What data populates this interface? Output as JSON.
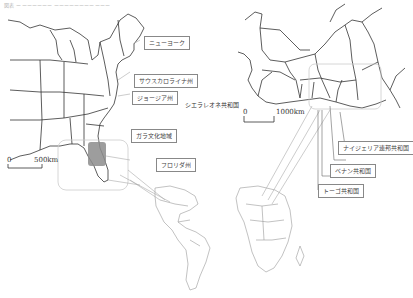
{
  "caption": "図表 ー ーーーーーー ーーーーーーーー ーーー",
  "labels": {
    "new_york": "ニューヨーク",
    "south_carolina": "サウスカロライナ州",
    "georgia": "ジョージア州",
    "gullah": "ガラ文化地域",
    "florida": "フロリダ州",
    "sierra_leone": "シエラレオネ共和国",
    "nigeria": "ナイジェリア連邦共和国",
    "benin": "ベナン共和国",
    "togo": "トーゴ共和国"
  },
  "scales": {
    "us": {
      "zero": "0",
      "distance": "500km"
    },
    "africa": {
      "zero": "0",
      "distance": "1000km"
    }
  },
  "colors": {
    "line": "#333333",
    "highlight": "#8c8c8c",
    "connector": "#999999",
    "frame": "#cccccc"
  }
}
